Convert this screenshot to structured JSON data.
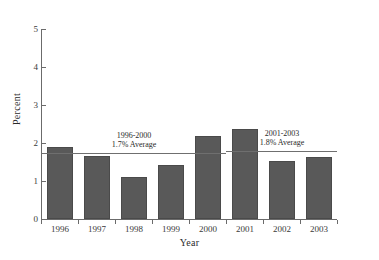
{
  "chart_data": {
    "type": "bar",
    "title": "",
    "xlabel": "Year",
    "ylabel": "Percent",
    "categories": [
      "1996",
      "1997",
      "1998",
      "1999",
      "2000",
      "2001",
      "2002",
      "2003"
    ],
    "values": [
      1.9,
      1.67,
      1.11,
      1.43,
      2.18,
      2.37,
      1.52,
      1.62
    ],
    "ylim": [
      0,
      5
    ],
    "yticks": [
      "0",
      "1",
      "2",
      "3",
      "4",
      "5"
    ],
    "ytick_values": [
      0,
      1,
      2,
      3,
      4,
      5
    ],
    "grid": false,
    "legend": "none",
    "bar_color": "#595959",
    "axis_color": "#6b6b6b",
    "annotations": [
      {
        "id": "avg-1996-2000",
        "period": "1996-2000",
        "label": "1.7% Average",
        "value": 1.75,
        "span_start_category": "1996",
        "span_end_category": "2000"
      },
      {
        "id": "avg-2001-2003",
        "period": "2001-2003",
        "label": "1.8% Average",
        "value": 1.8,
        "span_start_category": "2001",
        "span_end_category": "2003"
      }
    ]
  }
}
